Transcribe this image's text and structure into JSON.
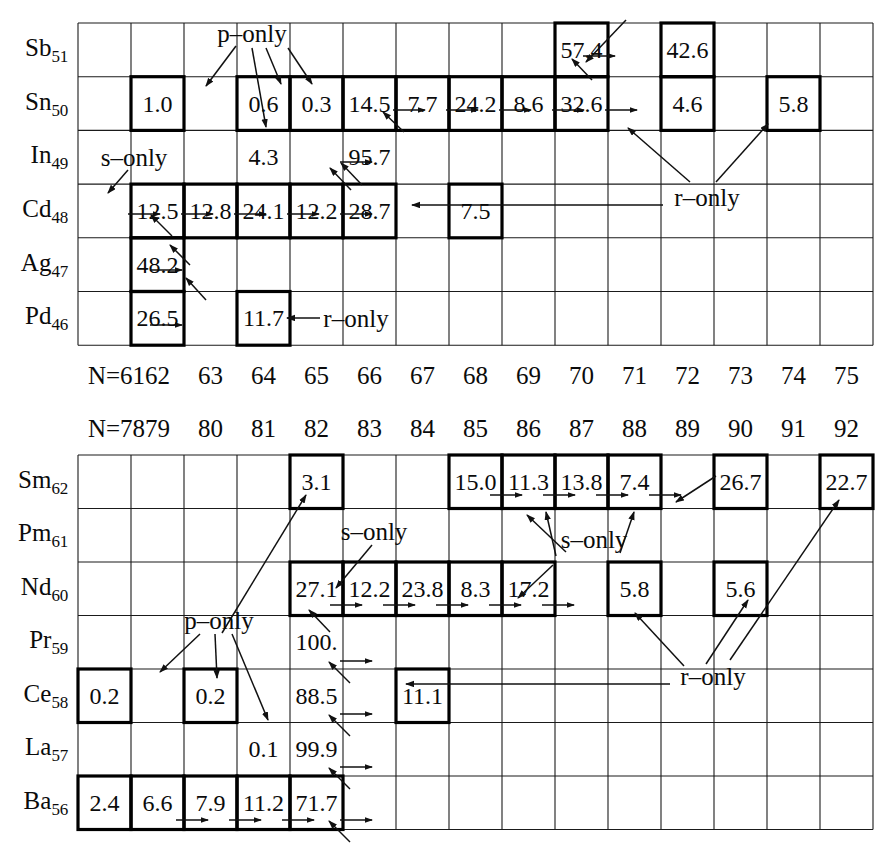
{
  "figure": {
    "type": "isotope-abundance-chart"
  },
  "panels": [
    {
      "id": "upper",
      "geometry": {
        "x0": 78,
        "y0": 23,
        "cell_w": 53.0,
        "cell_h": 53.7,
        "cols": 15,
        "rows": 6
      },
      "neutron_label_prefix": "N=",
      "neutron_numbers": [
        61,
        62,
        63,
        64,
        65,
        66,
        67,
        68,
        69,
        70,
        71,
        72,
        73,
        74,
        75
      ],
      "neutron_axis_y": 375,
      "rows": [
        {
          "element": "Sb",
          "z": "51"
        },
        {
          "element": "Sn",
          "z": "50"
        },
        {
          "element": "In",
          "z": "49"
        },
        {
          "element": "Cd",
          "z": "48"
        },
        {
          "element": "Ag",
          "z": "47"
        },
        {
          "element": "Pd",
          "z": "46"
        }
      ],
      "cells": [
        {
          "row": 0,
          "col": 9,
          "value": "57.4",
          "boxed": true
        },
        {
          "row": 0,
          "col": 11,
          "value": "42.6",
          "boxed": true
        },
        {
          "row": 1,
          "col": 1,
          "value": "1.0",
          "boxed": true
        },
        {
          "row": 1,
          "col": 3,
          "value": "0.6",
          "boxed": true
        },
        {
          "row": 1,
          "col": 4,
          "value": "0.3",
          "boxed": true
        },
        {
          "row": 1,
          "col": 5,
          "value": "14.5",
          "boxed": true
        },
        {
          "row": 1,
          "col": 6,
          "value": "7.7",
          "boxed": true
        },
        {
          "row": 1,
          "col": 7,
          "value": "24.2",
          "boxed": true
        },
        {
          "row": 1,
          "col": 8,
          "value": "8.6",
          "boxed": true
        },
        {
          "row": 1,
          "col": 9,
          "value": "32.6",
          "boxed": true
        },
        {
          "row": 1,
          "col": 11,
          "value": "4.6",
          "boxed": true
        },
        {
          "row": 1,
          "col": 13,
          "value": "5.8",
          "boxed": true
        },
        {
          "row": 2,
          "col": 3,
          "value": "4.3",
          "boxed": false
        },
        {
          "row": 2,
          "col": 5,
          "value": "95.7",
          "boxed": false
        },
        {
          "row": 3,
          "col": 1,
          "value": "12.5",
          "boxed": true
        },
        {
          "row": 3,
          "col": 2,
          "value": "12.8",
          "boxed": true
        },
        {
          "row": 3,
          "col": 3,
          "value": "24.1",
          "boxed": true
        },
        {
          "row": 3,
          "col": 4,
          "value": "12.2",
          "boxed": true
        },
        {
          "row": 3,
          "col": 5,
          "value": "28.7",
          "boxed": true
        },
        {
          "row": 3,
          "col": 7,
          "value": "7.5",
          "boxed": true
        },
        {
          "row": 4,
          "col": 1,
          "value": "48.2",
          "boxed": true
        },
        {
          "row": 5,
          "col": 1,
          "value": "26.5",
          "boxed": true
        },
        {
          "row": 5,
          "col": 3,
          "value": "11.7",
          "boxed": true
        }
      ],
      "annotations": [
        {
          "text": "p-only",
          "x": 252,
          "y": 33
        },
        {
          "text": "s-only",
          "x": 134,
          "y": 157
        },
        {
          "text": "r-only",
          "x": 707,
          "y": 197
        },
        {
          "text": "r-only",
          "x": 356,
          "y": 318
        }
      ]
    },
    {
      "id": "lower",
      "geometry": {
        "x0": 78,
        "y0": 455,
        "cell_w": 53.0,
        "cell_h": 53.5,
        "cols": 15,
        "rows": 7
      },
      "neutron_label_prefix": "N=",
      "neutron_numbers": [
        78,
        79,
        80,
        81,
        82,
        83,
        84,
        85,
        86,
        87,
        88,
        89,
        90,
        91,
        92
      ],
      "neutron_axis_y": 428,
      "rows": [
        {
          "element": "Sm",
          "z": "62"
        },
        {
          "element": "Pm",
          "z": "61"
        },
        {
          "element": "Nd",
          "z": "60"
        },
        {
          "element": "Pr",
          "z": "59"
        },
        {
          "element": "Ce",
          "z": "58"
        },
        {
          "element": "La",
          "z": "57"
        },
        {
          "element": "Ba",
          "z": "56"
        }
      ],
      "cells": [
        {
          "row": 0,
          "col": 4,
          "value": "3.1",
          "boxed": true
        },
        {
          "row": 0,
          "col": 7,
          "value": "15.0",
          "boxed": true
        },
        {
          "row": 0,
          "col": 8,
          "value": "11.3",
          "boxed": true
        },
        {
          "row": 0,
          "col": 9,
          "value": "13.8",
          "boxed": true
        },
        {
          "row": 0,
          "col": 10,
          "value": "7.4",
          "boxed": true
        },
        {
          "row": 0,
          "col": 12,
          "value": "26.7",
          "boxed": true
        },
        {
          "row": 0,
          "col": 14,
          "value": "22.7",
          "boxed": true
        },
        {
          "row": 2,
          "col": 4,
          "value": "27.1",
          "boxed": true
        },
        {
          "row": 2,
          "col": 5,
          "value": "12.2",
          "boxed": true
        },
        {
          "row": 2,
          "col": 6,
          "value": "23.8",
          "boxed": true
        },
        {
          "row": 2,
          "col": 7,
          "value": "8.3",
          "boxed": true
        },
        {
          "row": 2,
          "col": 8,
          "value": "17.2",
          "boxed": true
        },
        {
          "row": 2,
          "col": 10,
          "value": "5.8",
          "boxed": true
        },
        {
          "row": 2,
          "col": 12,
          "value": "5.6",
          "boxed": true
        },
        {
          "row": 3,
          "col": 4,
          "value": "100.",
          "boxed": false
        },
        {
          "row": 4,
          "col": 0,
          "value": "0.2",
          "boxed": true
        },
        {
          "row": 4,
          "col": 2,
          "value": "0.2",
          "boxed": true
        },
        {
          "row": 4,
          "col": 4,
          "value": "88.5",
          "boxed": false
        },
        {
          "row": 4,
          "col": 6,
          "value": "11.1",
          "boxed": true
        },
        {
          "row": 5,
          "col": 3,
          "value": "0.1",
          "boxed": false
        },
        {
          "row": 5,
          "col": 4,
          "value": "99.9",
          "boxed": false
        },
        {
          "row": 6,
          "col": 0,
          "value": "2.4",
          "boxed": true
        },
        {
          "row": 6,
          "col": 1,
          "value": "6.6",
          "boxed": true
        },
        {
          "row": 6,
          "col": 2,
          "value": "7.9",
          "boxed": true
        },
        {
          "row": 6,
          "col": 3,
          "value": "11.2",
          "boxed": true
        },
        {
          "row": 6,
          "col": 4,
          "value": "71.7",
          "boxed": true
        }
      ],
      "annotations": [
        {
          "text": "s-only",
          "x": 374,
          "y": 531
        },
        {
          "text": "s-only",
          "x": 594,
          "y": 539
        },
        {
          "text": "p-only",
          "x": 219,
          "y": 620
        },
        {
          "text": "r-only",
          "x": 713,
          "y": 676
        }
      ]
    }
  ],
  "style": {
    "grid_line": "#1a1a1a",
    "bold_line": "#000000",
    "text": "#0b0b0b",
    "background": "#ffffff"
  }
}
